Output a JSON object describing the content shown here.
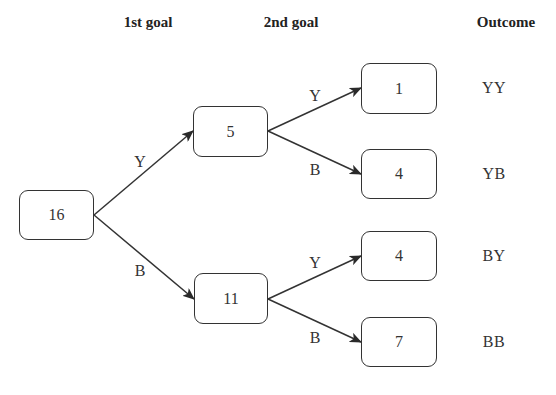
{
  "headers": {
    "first_goal": "1st goal",
    "second_goal": "2nd goal",
    "outcome": "Outcome"
  },
  "nodes": {
    "root": "16",
    "after_y": "5",
    "after_b": "11",
    "yy": "1",
    "yb": "4",
    "by": "4",
    "bb": "7"
  },
  "edges": {
    "root_to_y": "Y",
    "root_to_b": "B",
    "y_to_yy": "Y",
    "y_to_yb": "B",
    "b_to_by": "Y",
    "b_to_bb": "B"
  },
  "outcomes": [
    "YY",
    "YB",
    "BY",
    "BB"
  ],
  "colors": {
    "stroke": "#333333",
    "background": "#ffffff"
  }
}
